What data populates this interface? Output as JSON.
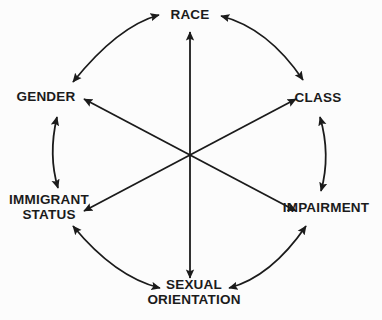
{
  "diagram": {
    "type": "cycle-diagram",
    "background_color": "#fcfcfc",
    "stroke_color": "#1b1b1b",
    "text_color": "#1b1b1b",
    "center": {
      "x": 190,
      "y": 155
    },
    "nodes": [
      {
        "id": "race",
        "label": "RACE",
        "x": 190,
        "y": 15,
        "lines": 1
      },
      {
        "id": "class",
        "label": "CLASS",
        "x": 318,
        "y": 98,
        "lines": 1
      },
      {
        "id": "impairment",
        "label": "IMPAIRMENT",
        "x": 326,
        "y": 208,
        "lines": 1
      },
      {
        "id": "sexual-orientation",
        "label": "SEXUAL\nORIENTATION",
        "x": 194,
        "y": 292,
        "lines": 2
      },
      {
        "id": "immigrant-status",
        "label": "IMMIGRANT\nSTATUS",
        "x": 49,
        "y": 207,
        "lines": 2
      },
      {
        "id": "gender",
        "label": "GENDER",
        "x": 46,
        "y": 97,
        "lines": 1
      }
    ],
    "perimeter_arcs": [
      {
        "id": "arc-gender-race",
        "from": "gender",
        "to": "race",
        "arrowheads": "both"
      },
      {
        "id": "arc-race-class",
        "from": "race",
        "to": "class",
        "arrowheads": "both"
      },
      {
        "id": "arc-class-impairment",
        "from": "class",
        "to": "impairment",
        "arrowheads": "both"
      },
      {
        "id": "arc-impairment-sexual-orientation",
        "from": "impairment",
        "to": "sexual-orientation",
        "arrowheads": "both"
      },
      {
        "id": "arc-sexual-orientation-immigrant-status",
        "from": "sexual-orientation",
        "to": "immigrant-status",
        "arrowheads": "both"
      },
      {
        "id": "arc-immigrant-status-gender",
        "from": "immigrant-status",
        "to": "gender",
        "arrowheads": "both"
      }
    ],
    "center_axes": [
      {
        "id": "axis-race-sexual-orientation",
        "from": "race",
        "to": "sexual-orientation",
        "arrowheads": "both"
      },
      {
        "id": "axis-gender-impairment",
        "from": "gender",
        "to": "impairment",
        "arrowheads": "both"
      },
      {
        "id": "axis-immigrant-status-class",
        "from": "immigrant-status",
        "to": "class",
        "arrowheads": "both"
      }
    ]
  }
}
